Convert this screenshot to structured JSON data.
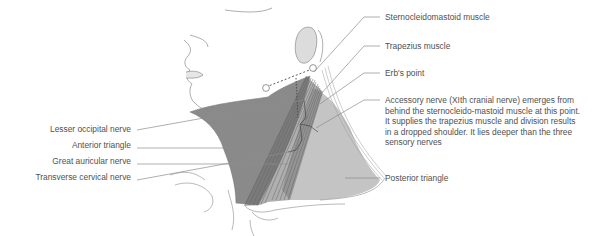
{
  "diagram": {
    "colors": {
      "anterior_triangle": "#8a8a8a",
      "posterior_triangle": "#c4c4c4",
      "muscle_dark": "#6e6e6e",
      "outline": "#7a7a7a",
      "leader_line": "#8c8c8c",
      "label_text": "#505050",
      "background": "#ffffff"
    },
    "left_labels": [
      {
        "id": "lesser-occipital-nerve",
        "text": "Lesser occipital nerve"
      },
      {
        "id": "anterior-triangle",
        "text": "Anterior triangle"
      },
      {
        "id": "great-auricular-nerve",
        "text": "Great auricular nerve"
      },
      {
        "id": "transverse-cervical-nerve",
        "text": "Transverse cervical nerve"
      }
    ],
    "right_labels": [
      {
        "id": "sternocleidomastoid-muscle",
        "text": "Sternocleidomastoid muscle"
      },
      {
        "id": "trapezius-muscle",
        "text": "Trapezius muscle"
      },
      {
        "id": "erbs-point",
        "text": "Erb's point"
      },
      {
        "id": "accessory-nerve",
        "text": "Accessory nerve (XIth cranial nerve) emerges from behind the sternocleido-mastoid muscle at this point. It supplies the trapezius muscle and division results in a dropped shoulder. It lies deeper than the three sensory nerves"
      },
      {
        "id": "posterior-triangle",
        "text": "Posterior triangle"
      }
    ]
  }
}
